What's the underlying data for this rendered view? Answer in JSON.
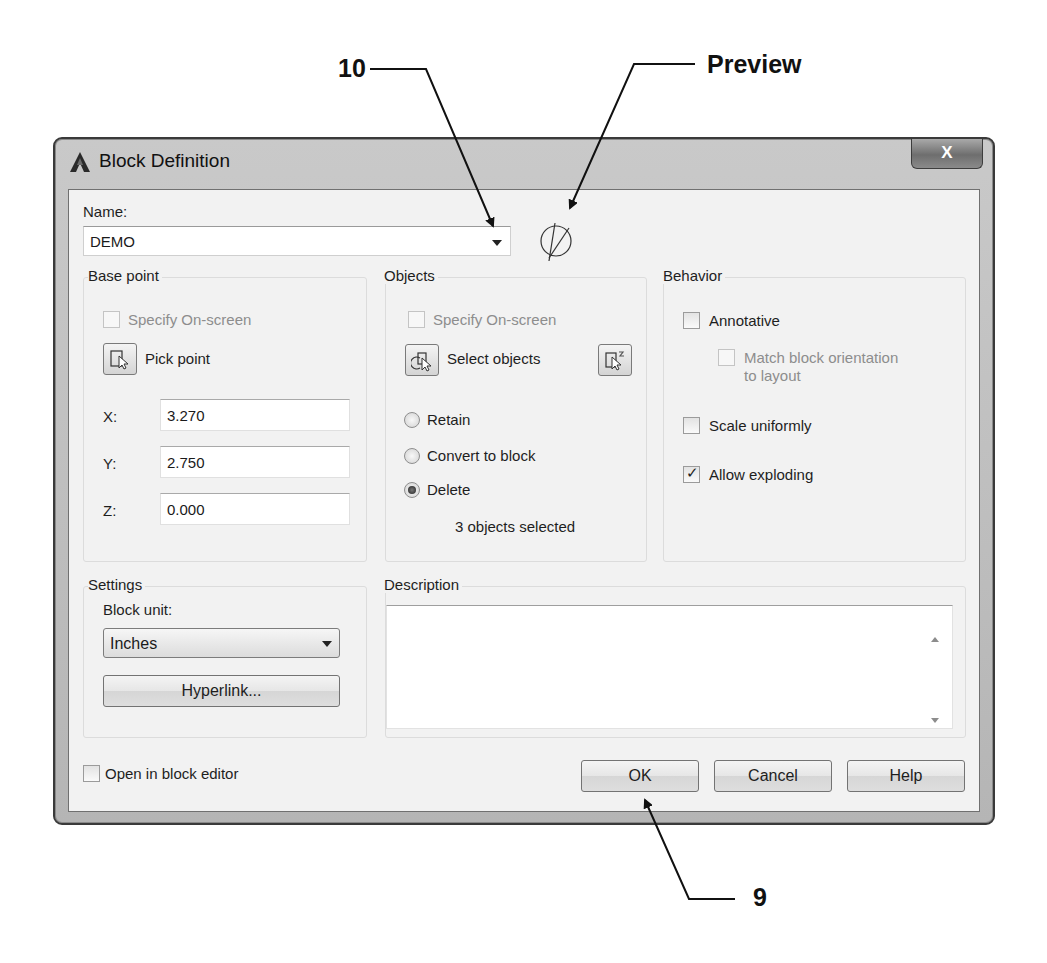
{
  "callouts": {
    "label_10": "10",
    "label_preview": "Preview",
    "label_9": "9"
  },
  "dialog": {
    "title": "Block Definition",
    "close_label": "X",
    "name_label": "Name:",
    "name_value": "DEMO",
    "base_point": {
      "title": "Base point",
      "specify_onscreen": "Specify On-screen",
      "specify_onscreen_checked": false,
      "pick_point": "Pick point",
      "x_label": "X:",
      "x_value": "3.270",
      "y_label": "Y:",
      "y_value": "2.750",
      "z_label": "Z:",
      "z_value": "0.000"
    },
    "objects": {
      "title": "Objects",
      "specify_onscreen": "Specify On-screen",
      "specify_onscreen_checked": false,
      "select_objects": "Select objects",
      "options": [
        {
          "label": "Retain",
          "selected": false
        },
        {
          "label": "Convert to block",
          "selected": false
        },
        {
          "label": "Delete",
          "selected": true
        }
      ],
      "status": "3 objects selected"
    },
    "behavior": {
      "title": "Behavior",
      "annotative": "Annotative",
      "annotative_checked": false,
      "match_orientation_line1": "Match block orientation",
      "match_orientation_line2": "to layout",
      "match_orientation_checked": false,
      "scale_uniformly": "Scale uniformly",
      "scale_uniformly_checked": false,
      "allow_exploding": "Allow exploding",
      "allow_exploding_checked": true
    },
    "settings": {
      "title": "Settings",
      "block_unit_label": "Block unit:",
      "block_unit_value": "Inches",
      "hyperlink_button": "Hyperlink..."
    },
    "description": {
      "title": "Description",
      "value": ""
    },
    "open_in_block_editor": "Open in block editor",
    "open_in_block_editor_checked": false,
    "buttons": {
      "ok": "OK",
      "cancel": "Cancel",
      "help": "Help"
    }
  }
}
